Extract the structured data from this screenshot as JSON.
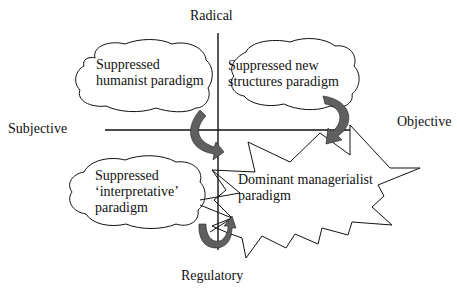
{
  "axes": {
    "top_label": "Radical",
    "bottom_label": "Regulatory",
    "left_label": "Subjective",
    "right_label": "Objective"
  },
  "paradigms": [
    {
      "id": "humanist",
      "label": "Suppressed\nhumanist paradigm",
      "shape": "cloud",
      "quadrant": "radical-subjective"
    },
    {
      "id": "new-structures",
      "label": "Suppressed new\nstructures paradigm",
      "shape": "cloud",
      "quadrant": "radical-objective"
    },
    {
      "id": "interpretative",
      "label": "Suppressed\n‘interpretative’\nparadigm",
      "shape": "cloud",
      "quadrant": "regulatory-subjective"
    },
    {
      "id": "managerialist",
      "label": "Dominant managerialist\nparadigm",
      "shape": "starburst",
      "quadrant": "regulatory-objective"
    }
  ],
  "arrows": [
    {
      "from": "humanist",
      "to": "managerialist"
    },
    {
      "from": "new-structures",
      "to": "managerialist"
    },
    {
      "from": "interpretative",
      "to": "managerialist"
    }
  ],
  "colors": {
    "line": "#111111",
    "arrow_fill": "#5f5f5f",
    "background": "#ffffff"
  }
}
